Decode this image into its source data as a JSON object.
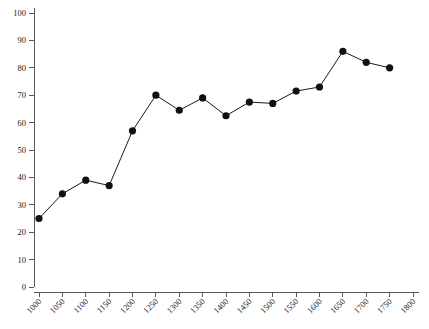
{
  "chart_data": {
    "type": "line",
    "title": "",
    "subtitle": "",
    "xlabel": "",
    "ylabel": "",
    "xlim": [
      1000,
      1800
    ],
    "ylim": [
      0,
      100
    ],
    "grid": false,
    "legend": null,
    "marker": "filled-circle",
    "line_color": "#1a1a1a",
    "marker_color": "#111111",
    "axis_color": "#5a5a5a",
    "background_color": "#ffffff",
    "x_tick_labels": [
      "1000",
      "1050",
      "1100",
      "1150",
      "1200",
      "1250",
      "1300",
      "1350",
      "1400",
      "1450",
      "1500",
      "1550",
      "1600",
      "1650",
      "1700",
      "1750",
      "1800"
    ],
    "x_tick_values": [
      1000,
      1050,
      1100,
      1150,
      1200,
      1250,
      1300,
      1350,
      1400,
      1450,
      1500,
      1550,
      1600,
      1650,
      1700,
      1750,
      1800
    ],
    "x_tick_label_rotation": -45,
    "y_tick_labels": [
      "0",
      "10",
      "20",
      "30",
      "40",
      "50",
      "60",
      "70",
      "80",
      "90",
      "100"
    ],
    "y_tick_values": [
      0,
      10,
      20,
      30,
      40,
      50,
      60,
      70,
      80,
      90,
      100
    ],
    "x": [
      1000,
      1050,
      1100,
      1150,
      1200,
      1250,
      1300,
      1350,
      1400,
      1450,
      1500,
      1550,
      1600,
      1650,
      1700,
      1750
    ],
    "values": [
      25,
      34,
      39,
      37,
      57,
      70,
      64.5,
      69,
      62.5,
      67.5,
      67,
      71.5,
      73,
      86,
      82,
      80
    ],
    "series": [
      {
        "name": "series-1",
        "x": [
          1000,
          1050,
          1100,
          1150,
          1200,
          1250,
          1300,
          1350,
          1400,
          1450,
          1500,
          1550,
          1600,
          1650,
          1700,
          1750
        ],
        "values": [
          25,
          34,
          39,
          37,
          57,
          70,
          64.5,
          69,
          62.5,
          67.5,
          67,
          71.5,
          73,
          86,
          82,
          80
        ]
      }
    ]
  }
}
